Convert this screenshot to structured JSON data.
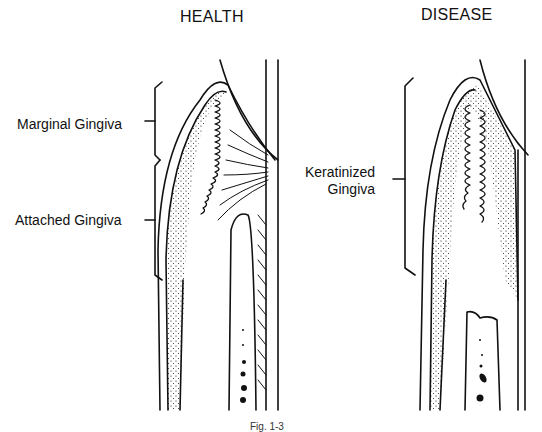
{
  "titles": {
    "left": "HEALTH",
    "right": "DISEASE"
  },
  "labels": {
    "marginal": "Marginal Gingiva",
    "attached": "Attached Gingiva",
    "keratinized_line1": "Keratinized",
    "keratinized_line2": "Gingiva"
  },
  "caption": "Fig. 1-3",
  "colors": {
    "ink": "#111111",
    "background": "#ffffff"
  }
}
